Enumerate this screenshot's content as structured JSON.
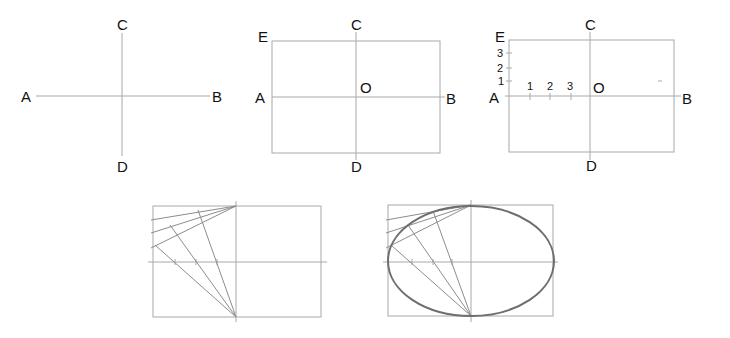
{
  "figure": {
    "colors": {
      "background": "#ffffff",
      "construction_line": "#a8a8a8",
      "ellipse": "#6e6e6e",
      "text": "#111111"
    },
    "step1": {
      "labels": {
        "a": "A",
        "b": "B",
        "c": "C",
        "d": "D"
      }
    },
    "step2": {
      "labels": {
        "a": "A",
        "b": "B",
        "c": "C",
        "d": "D",
        "e": "E",
        "o": "O"
      }
    },
    "step3": {
      "labels": {
        "a": "A",
        "b": "B",
        "c": "C",
        "d": "D",
        "e": "E",
        "o": "O"
      },
      "vertical_divisions": [
        "1",
        "2",
        "3"
      ],
      "horizontal_divisions": [
        "1",
        "2",
        "3"
      ]
    },
    "step4": {
      "description": "Rays from C to divisions on AE intersect rays from D through divisions on AO"
    },
    "step5": {
      "description": "Smooth curve through intersection points forms the ellipse"
    }
  }
}
